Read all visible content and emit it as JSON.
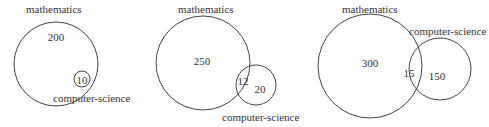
{
  "diagrams": [
    {
      "set_a_label": "mathematics",
      "set_b_label": "computer-science",
      "a_only": "200",
      "b_value": "10",
      "relation": "subset"
    },
    {
      "set_a_label": "mathematics",
      "set_b_label": "computer-science",
      "a_only": "250",
      "intersection": "12",
      "b_only": "20",
      "relation": "overlap"
    },
    {
      "set_a_label": "mathematics",
      "set_b_label": "computer-science",
      "a_only": "300",
      "intersection": "15",
      "b_only": "150",
      "relation": "overlap"
    }
  ],
  "colors": {
    "stroke": "#444444",
    "text": "#333333"
  }
}
